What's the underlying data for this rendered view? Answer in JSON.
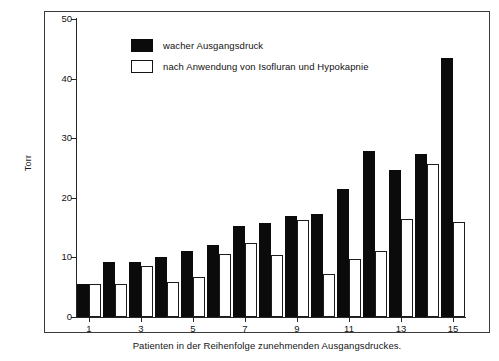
{
  "chart_data": {
    "type": "bar",
    "title": "",
    "subtitle": "",
    "xlabel": "Patienten in der Reihenfolge zunehmenden Ausgangsdruckes.",
    "ylabel": "Torr",
    "ylim": [
      0,
      50
    ],
    "yticks": [
      0,
      10,
      20,
      30,
      40,
      50
    ],
    "grid": false,
    "legend_position": "upper-left",
    "categories": [
      "1",
      "2",
      "3",
      "4",
      "5",
      "6",
      "7",
      "8",
      "9",
      "10",
      "11",
      "12",
      "13",
      "14",
      "15"
    ],
    "xtick_labels": [
      "1",
      "3",
      "5",
      "7",
      "9",
      "11",
      "13",
      "15"
    ],
    "series": [
      {
        "name": "wacher Ausgangsdruck",
        "color": "#0b0b0b",
        "values": [
          5.6,
          9.3,
          9.2,
          10.0,
          11.0,
          12.0,
          15.2,
          15.8,
          17.0,
          17.3,
          21.4,
          27.9,
          24.7,
          27.3,
          43.5
        ]
      },
      {
        "name": "nach Anwendung von Isofluran und Hypokapnie",
        "color": "#ffffff",
        "values": [
          5.6,
          5.6,
          8.5,
          5.8,
          6.7,
          10.5,
          12.4,
          10.4,
          16.3,
          7.2,
          9.7,
          11.0,
          16.4,
          25.6,
          15.9
        ]
      }
    ]
  },
  "legend": {
    "items": [
      {
        "label": "wacher Ausgangsdruck",
        "swatch": "dark"
      },
      {
        "label": "nach Anwendung von Isofluran und Hypokapnie",
        "swatch": "light"
      }
    ]
  },
  "axes": {
    "y_label": "Torr",
    "x_caption": "Patienten in der Reihenfolge zunehmenden Ausgangsdruckes."
  }
}
